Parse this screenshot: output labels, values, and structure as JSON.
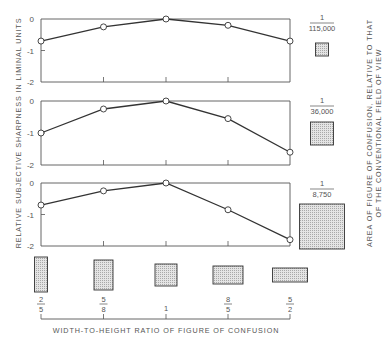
{
  "chart_data": [
    {
      "type": "line",
      "panel": "top",
      "area_fraction_label": {
        "numerator": "1",
        "denominator": "115,000"
      },
      "categories": [
        "2/5",
        "5/8",
        "1",
        "8/5",
        "5/2"
      ],
      "values": [
        -0.7,
        -0.25,
        0,
        -0.2,
        -0.7
      ],
      "ylim": [
        -2,
        0
      ],
      "yticks": [
        "0",
        "-1",
        "-2"
      ]
    },
    {
      "type": "line",
      "panel": "middle",
      "area_fraction_label": {
        "numerator": "1",
        "denominator": "36,000"
      },
      "categories": [
        "2/5",
        "5/8",
        "1",
        "8/5",
        "5/2"
      ],
      "values": [
        -1.0,
        -0.25,
        0,
        -0.55,
        -1.6
      ],
      "ylim": [
        -2,
        0
      ],
      "yticks": [
        "0",
        "-1",
        "-2"
      ]
    },
    {
      "type": "line",
      "panel": "bottom",
      "area_fraction_label": {
        "numerator": "1",
        "denominator": "8,750"
      },
      "categories": [
        "2/5",
        "5/8",
        "1",
        "8/5",
        "5/2"
      ],
      "values": [
        -0.7,
        -0.25,
        0,
        -0.85,
        -1.8
      ],
      "ylim": [
        -2,
        0
      ],
      "yticks": [
        "0",
        "-1",
        "-2"
      ]
    }
  ],
  "labels": {
    "ylabel": "RELATIVE SUBJECTIVE SHARPNESS IN LIMINAL UNITS",
    "xlabel": "WIDTH-TO-HEIGHT RATIO OF FIGURE OF CONFUSION",
    "right_label_line1": "AREA OF FIGURE OF CONFUSION, RELATIVE TO THAT",
    "right_label_line2": "OF THE CONVENTIONAL FIELD OF VIEW"
  },
  "ratios": [
    {
      "num": "2",
      "den": "5"
    },
    {
      "num": "5",
      "den": "8"
    },
    {
      "num": "1",
      "den": ""
    },
    {
      "num": "8",
      "den": "5"
    },
    {
      "num": "5",
      "den": "2"
    }
  ],
  "colors": {
    "line": "#333333",
    "frame": "#555555",
    "fill": "#cfcfcf"
  }
}
